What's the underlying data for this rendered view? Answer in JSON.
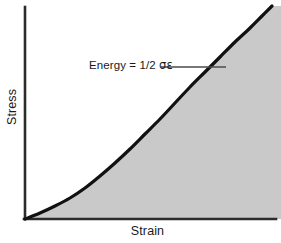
{
  "figure": {
    "width": 281,
    "height": 243,
    "background_color": "#ffffff"
  },
  "axes": {
    "x_label": "Strain",
    "y_label": "Stress",
    "axis_color": "#2b2b2b",
    "x_axis": {
      "x1": 25,
      "y1": 219,
      "x2": 276,
      "y2": 219
    },
    "y_axis": {
      "x1": 25,
      "y1": 7,
      "x2": 25,
      "y2": 219
    }
  },
  "annotation": {
    "text_prefix": "Energy = 1/2 ",
    "greek_symbols": "σε",
    "full_text": "Energy = 1/2 σε",
    "leader_line": {
      "x1": 161,
      "y1": 67,
      "x2": 226,
      "y2": 67
    },
    "leader_color": "#4a4a4a"
  },
  "chart_data": {
    "type": "area",
    "title": "",
    "xlabel": "Strain",
    "ylabel": "Stress",
    "xlim": [
      0,
      1
    ],
    "ylim": [
      0,
      1
    ],
    "grid": false,
    "legend": "none",
    "curve_color": "#111111",
    "curve_width": 3.2,
    "fill_color": "#c9c9c9",
    "fill_description": "shaded area under the stress-strain curve representing strain energy",
    "x": [
      0.0,
      0.06,
      0.12,
      0.18,
      0.24,
      0.3,
      0.36,
      0.42,
      0.48,
      0.54,
      0.6,
      0.66,
      0.72,
      0.78,
      0.84,
      0.9,
      0.96,
      1.0
    ],
    "y": [
      0.0,
      0.03,
      0.06,
      0.1,
      0.15,
      0.21,
      0.28,
      0.35,
      0.43,
      0.51,
      0.59,
      0.67,
      0.75,
      0.82,
      0.88,
      0.93,
      0.97,
      1.0
    ],
    "svg_path_points": [
      [
        25,
        219
      ],
      [
        40,
        213
      ],
      [
        55,
        206
      ],
      [
        70,
        198
      ],
      [
        85,
        188
      ],
      [
        100,
        176
      ],
      [
        115,
        163
      ],
      [
        130,
        149
      ],
      [
        145,
        134
      ],
      [
        160,
        119
      ],
      [
        175,
        103
      ],
      [
        190,
        87
      ],
      [
        205,
        72
      ],
      [
        220,
        57
      ],
      [
        235,
        42
      ],
      [
        250,
        28
      ],
      [
        262,
        16
      ],
      [
        272,
        6
      ]
    ],
    "annotations": [
      {
        "text": "Energy = 1/2 σε",
        "x": 89,
        "y": 68
      }
    ]
  }
}
